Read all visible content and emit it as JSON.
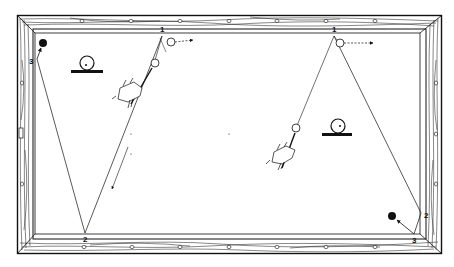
{
  "diagram": {
    "colors": {
      "ink": "#111111",
      "paper": "#ffffff",
      "rail_wood": "#ffffff"
    },
    "left_shot": {
      "cushion_labels": [
        "1",
        "2",
        "3"
      ],
      "legend_symbol": "ball-on-base-icon"
    },
    "right_shot": {
      "cushion_labels": [
        "1",
        "2",
        "3"
      ],
      "legend_symbol": "ball-on-base-icon"
    }
  }
}
